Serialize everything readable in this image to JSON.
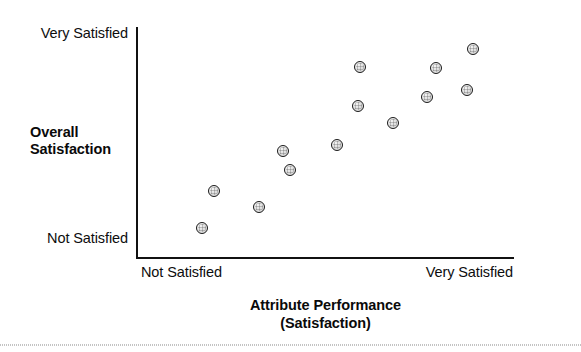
{
  "figure": {
    "background_color": "#ffffff",
    "axis_color": "#111111",
    "marker_fill": "#d6d6d6",
    "marker_stroke": "#1b1b1b"
  },
  "axes": {
    "y_top_label": "Very Satisfied",
    "y_bottom_label": "Not Satisfied",
    "y_title_line1": "Overall",
    "y_title_line2": "Satisfaction",
    "x_left_label": "Not Satisfied",
    "x_right_label": "Very Satisfied",
    "x_title_line1": "Attribute Performance",
    "x_title_line2": "(Satisfaction)"
  },
  "chart_data": {
    "type": "scatter",
    "title": "",
    "subtitle": "",
    "xlabel": "Attribute Performance (Satisfaction)",
    "ylabel": "Overall Satisfaction",
    "grid": false,
    "legend": "none",
    "xlim": [
      0,
      100
    ],
    "ylim": [
      0,
      100
    ],
    "xtick_labels": [
      "Not Satisfied",
      "Very Satisfied"
    ],
    "ytick_labels": [
      "Not Satisfied",
      "Very Satisfied"
    ],
    "n_points": 13,
    "points": [
      {
        "x": 17.2,
        "y": 13.0
      },
      {
        "x": 20.4,
        "y": 29.0
      },
      {
        "x": 32.4,
        "y": 22.1
      },
      {
        "x": 38.7,
        "y": 46.3
      },
      {
        "x": 40.6,
        "y": 38.1
      },
      {
        "x": 53.1,
        "y": 48.9
      },
      {
        "x": 59.2,
        "y": 82.7
      },
      {
        "x": 58.6,
        "y": 65.8
      },
      {
        "x": 67.9,
        "y": 58.4
      },
      {
        "x": 76.9,
        "y": 69.7
      },
      {
        "x": 79.3,
        "y": 82.3
      },
      {
        "x": 87.5,
        "y": 72.7
      },
      {
        "x": 89.1,
        "y": 90.5
      }
    ],
    "relationship": "positive linear"
  }
}
